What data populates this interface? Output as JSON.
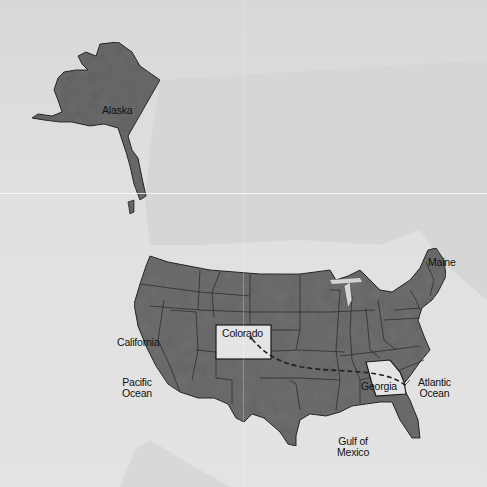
{
  "map": {
    "title": "United States map with route from Colorado to Georgia",
    "colors": {
      "water": "#dedede",
      "land_background": "#d3d3d3",
      "states_fill": "#6e6e6e",
      "highlight_fill": "#e6e6e6",
      "border": "#1e1e1e",
      "route": "#222222"
    },
    "labels": {
      "alaska": "Alaska",
      "maine": "Maine",
      "california": "California",
      "colorado": "Colorado",
      "georgia": "Georgia",
      "pacific_line1": "Pacific",
      "pacific_line2": "Ocean",
      "atlantic_line1": "Atlantic",
      "atlantic_line2": "Ocean",
      "gulf_line1": "Gulf of",
      "gulf_line2": "Mexico"
    },
    "highlighted_states": [
      "Colorado",
      "Georgia"
    ],
    "route": {
      "from": "Colorado",
      "to": "Georgia",
      "style": "dashed"
    }
  }
}
